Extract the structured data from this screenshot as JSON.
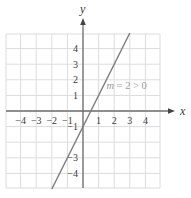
{
  "chart_data": {
    "type": "line",
    "title": "",
    "xlabel": "x",
    "ylabel": "y",
    "xlim": [
      -5,
      5
    ],
    "ylim": [
      -5,
      5
    ],
    "grid": true,
    "x_ticks": [
      "-4",
      "-3",
      "-2",
      "-1",
      "1",
      "2",
      "3",
      "4"
    ],
    "y_ticks": [
      "4",
      "3",
      "2",
      "1",
      "-1",
      "-3",
      "-4"
    ],
    "series": [
      {
        "name": "y = 2x - 1",
        "slope": 2,
        "intercept": -1,
        "x": [
          -2,
          3
        ],
        "y": [
          -5,
          5
        ]
      }
    ],
    "annotations": [
      {
        "text": "m = 2 > 0",
        "x": 1.5,
        "y": 1.4
      }
    ],
    "colors": {
      "line": "#7a7a7a",
      "axes": "#6e6e6e",
      "grid": "#dcdcdc",
      "annotation": "#9a9a9a"
    }
  }
}
